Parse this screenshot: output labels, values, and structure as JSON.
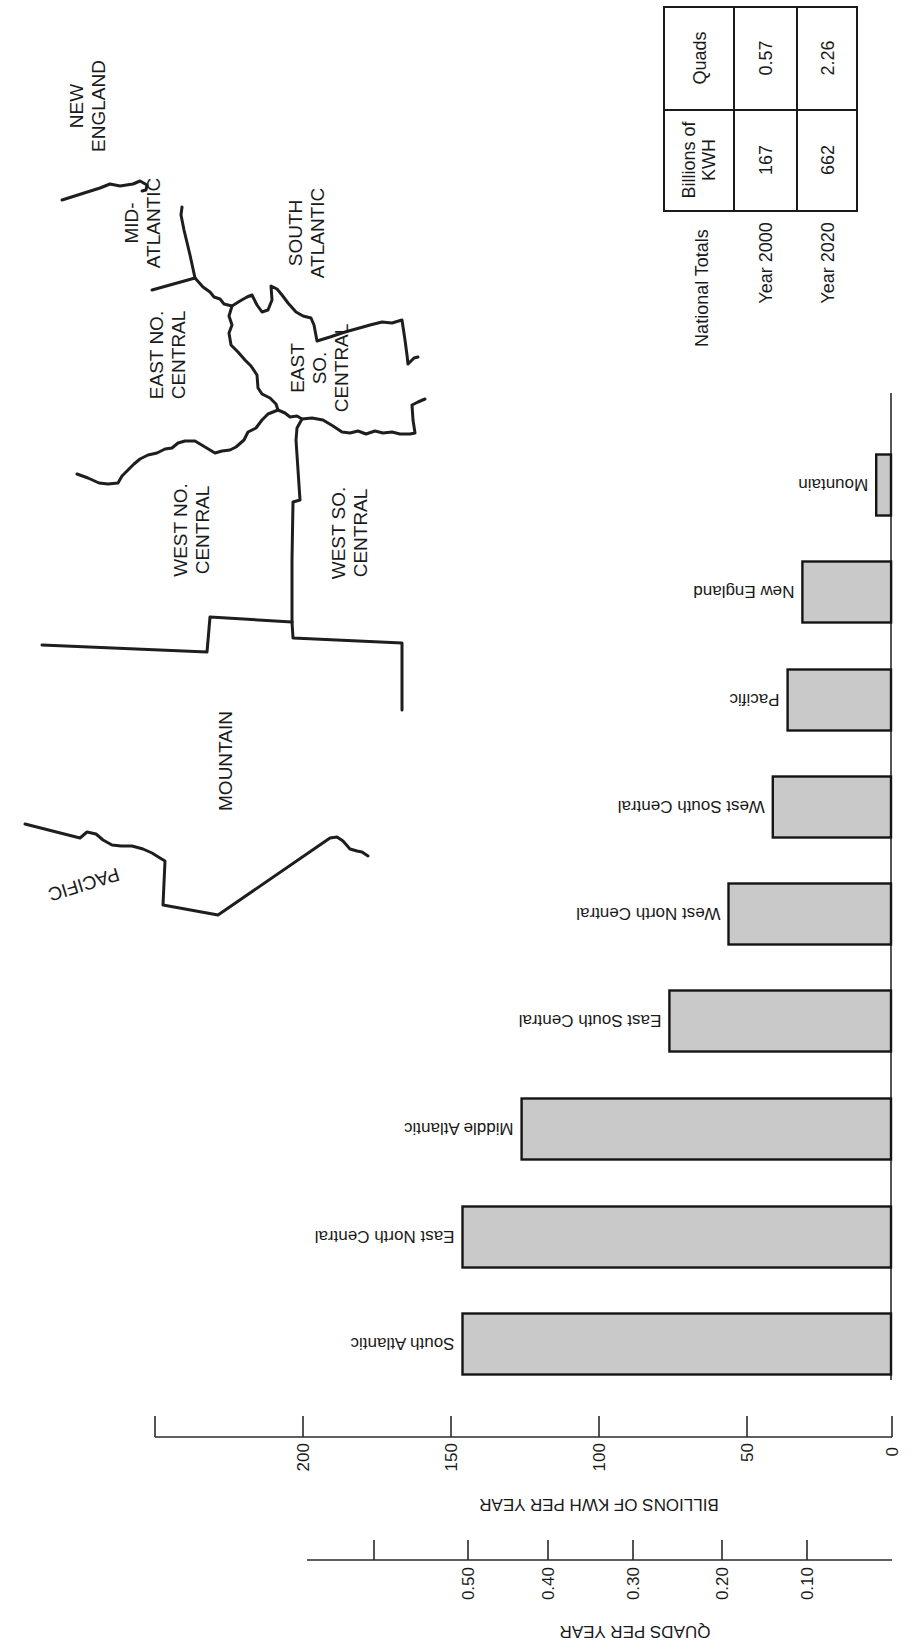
{
  "map": {
    "labels": {
      "new_england_1": "NEW",
      "new_england_2": "ENGLAND",
      "mid_atlantic_1": "MID-",
      "mid_atlantic_2": "ATLANTIC",
      "south_atlantic_1": "SOUTH",
      "south_atlantic_2": "ATLANTIC",
      "east_no_central_1": "EAST NO.",
      "east_no_central_2": "CENTRAL",
      "east_so_central_1": "EAST",
      "east_so_central_2": "SO.",
      "east_so_central_3": "CENTRAL",
      "west_no_central_1": "WEST NO.",
      "west_no_central_2": "CENTRAL",
      "west_so_central_1": "WEST SO.",
      "west_so_central_2": "CENTRAL",
      "mountain": "MOUNTAIN",
      "pacific": "PACIFIC"
    }
  },
  "totals_table": {
    "row_label_header": "National Totals",
    "col_headers": [
      "Year 2000",
      "Year 2020"
    ],
    "rows": [
      {
        "label": "Quads",
        "values": [
          "0.57",
          "2.26"
        ]
      },
      {
        "label_1": "Billions of",
        "label_2": "KWH",
        "values": [
          "167",
          "662"
        ]
      }
    ]
  },
  "chart_data": {
    "type": "bar",
    "orientation": "horizontal (rotated 180°, bars grow leftward from baseline)",
    "title": "",
    "categories": [
      "South Atlantic",
      "East North Central",
      "Middle Atlantic",
      "East South Central",
      "West North Central",
      "West South Central",
      "Pacific",
      "New England",
      "Mountain"
    ],
    "values": [
      145,
      145,
      125,
      75,
      55,
      40,
      35,
      30,
      5
    ],
    "xlabel": "BILLIONS OF KWH PER YEAR",
    "secondary_axis_label": "QUADS PER YEAR",
    "xlim": [
      0,
      250
    ],
    "primary_ticks": [
      "0",
      "50",
      "100",
      "150",
      "200"
    ],
    "secondary_ticks": [
      "0.10",
      "0.20",
      "0.30",
      "0.40",
      "0.50"
    ],
    "grid": false,
    "legend": null,
    "annotation_table": {
      "National Totals": {
        "Year 2000": {
          "Billions of KWH": 167,
          "Quads": 0.57
        },
        "Year 2020": {
          "Billions of KWH": 662,
          "Quads": 2.26
        }
      }
    }
  },
  "axes": {
    "kwh_title": "BILLIONS OF KWH PER YEAR",
    "kwh_ticks": [
      "0",
      "50",
      "100",
      "150",
      "200"
    ],
    "quads_title": "QUADS PER YEAR",
    "quads_ticks": [
      "0.10",
      "0.20",
      "0.30",
      "0.40",
      "0.50"
    ]
  },
  "bars": [
    {
      "label": "South Atlantic",
      "value": 145
    },
    {
      "label": "East North Central",
      "value": 145
    },
    {
      "label": "Middle Atlantic",
      "value": 125
    },
    {
      "label": "East South Central",
      "value": 75
    },
    {
      "label": "West North Central",
      "value": 55
    },
    {
      "label": "West South Central",
      "value": 40
    },
    {
      "label": "Pacific",
      "value": 35
    },
    {
      "label": "New England",
      "value": 30
    },
    {
      "label": "Mountain",
      "value": 5
    }
  ]
}
